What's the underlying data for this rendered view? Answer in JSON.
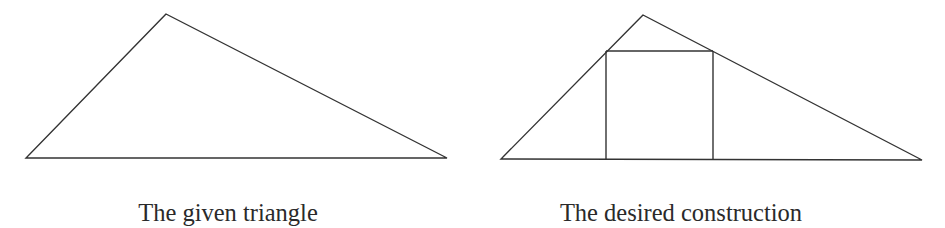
{
  "figure": {
    "stroke_color": "#333333",
    "panels": [
      {
        "id": "given",
        "caption": "The given triangle",
        "triangle": {
          "apex": [
            166,
            14
          ],
          "base_left": [
            26,
            158
          ],
          "base_right": [
            447,
            158
          ]
        }
      },
      {
        "id": "construction",
        "caption": "The desired construction",
        "triangle": {
          "apex": [
            643,
            15
          ],
          "base_left": [
            501,
            159
          ],
          "base_right": [
            922,
            160
          ]
        },
        "inscribed_rectangle": {
          "top_left": [
            606,
            51
          ],
          "top_right": [
            713,
            51
          ],
          "bottom_left": [
            606,
            159
          ],
          "bottom_right": [
            713,
            160
          ]
        }
      }
    ]
  }
}
